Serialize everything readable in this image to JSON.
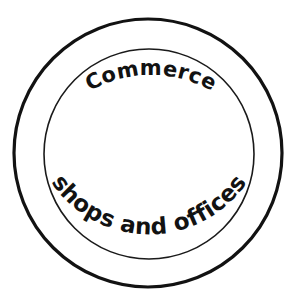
{
  "diagram": {
    "type": "concentric-ring-label",
    "background_color": "#ffffff",
    "stroke_color": "#121212",
    "title_top": "Commerce",
    "title_bottom": "shops and offices",
    "interior_fill": "#ffffff",
    "interior_content": "",
    "outer_circle": {
      "name": "outer-ring",
      "center_x": 148,
      "center_y": 153,
      "radius": 134,
      "stroke_width": 3.2,
      "color": "#121212"
    },
    "inner_circle": {
      "name": "inner-ring",
      "center_x": 149,
      "center_y": 154,
      "radius": 105,
      "stroke_width": 1.6,
      "color": "#1a1a1a"
    },
    "top_label": {
      "text": "Commerce",
      "font_size": 21,
      "weight": "bold",
      "arc_radius": 122,
      "position": "top-arc",
      "color": "#121212"
    },
    "bottom_label": {
      "text": "shops and offices",
      "font_size": 23,
      "weight": "bold",
      "arc_radius": 118,
      "position": "bottom-arc",
      "color": "#121212"
    }
  }
}
